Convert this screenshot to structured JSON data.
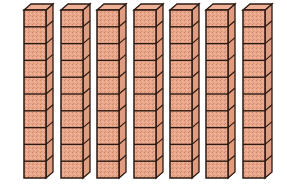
{
  "figure": {
    "rod_count": 7,
    "cubes_per_rod": 10,
    "total_value": 70
  },
  "style": {
    "face_color": "#e9a68a",
    "side_color": "#e09c80",
    "top_color": "#eeb096",
    "speckle_color": "#c9856a",
    "outline_color": "#2b1a12",
    "background": "#ffffff"
  },
  "layout": {
    "rod_x": [
      24,
      61,
      97,
      134,
      170,
      206,
      243
    ],
    "front_top": 10,
    "front_bottom": 178,
    "front_width": 22,
    "depth_dx": 7,
    "depth_dy": 6
  }
}
